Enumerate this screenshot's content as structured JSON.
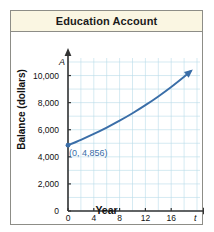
{
  "figure": {
    "title": "Education Account"
  },
  "chart_data": {
    "type": "line",
    "title": "Education Account",
    "xlabel": "Year",
    "ylabel": "Balance (dollars)",
    "x_axis_variable": "t",
    "y_axis_variable": "A",
    "xlim": [
      0,
      20
    ],
    "ylim": [
      0,
      11000
    ],
    "xticks": [
      0,
      4,
      8,
      12,
      16
    ],
    "xtick_labels": [
      "0",
      "4",
      "8",
      "12",
      "16"
    ],
    "yticks": [
      0,
      2000,
      4000,
      6000,
      8000,
      10000
    ],
    "ytick_labels": [
      "0",
      "2,000",
      "4,000",
      "6,000",
      "8,000",
      "10,000"
    ],
    "grid": true,
    "grid_color": "#b9dcea",
    "legend": null,
    "series": [
      {
        "name": "Balance",
        "color": "#3a6ea8",
        "arrow_end": true,
        "x": [
          0,
          2,
          4,
          6,
          8,
          10,
          12,
          14,
          16,
          18,
          19
        ],
        "values": [
          4856,
          5257,
          5691,
          6161,
          6669,
          7219,
          7814,
          8459,
          9156,
          9911,
          10311
        ]
      }
    ],
    "annotations": [
      {
        "name": "initial-balance-point",
        "text": "(0, 4,856)",
        "x": 0,
        "y": 4856,
        "color": "#3a6ea8",
        "marker": true
      }
    ]
  }
}
